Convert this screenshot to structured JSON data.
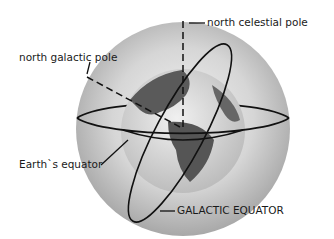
{
  "diagram": {
    "labels": {
      "north_celestial_pole": "north celestial pole",
      "north_galactic_pole": "north galactic pole",
      "earths_equator": "Earth`s equator",
      "galactic_equator": "GALACTIC EQUATOR"
    },
    "colors": {
      "background": "#ffffff",
      "celestial_sphere": "#cfcfcf",
      "earth_land": "#555555",
      "earth_ocean": "#d9d9d9",
      "lines": "#111111"
    }
  }
}
